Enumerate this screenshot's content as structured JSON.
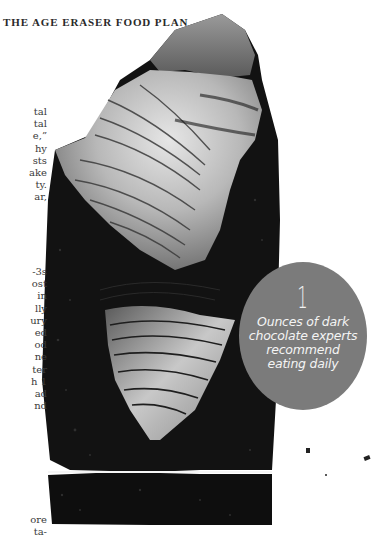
{
  "page": {
    "running_head": "THE AGE ERASER FOOD PLAN"
  },
  "body_text": {
    "paragraph_1_line_endings": [
      "tal",
      "tal",
      "e,”",
      "hy",
      "sts",
      "ake",
      "ty.",
      "ar,"
    ],
    "paragraph_2_line_endings": [
      "-3s",
      "ost",
      "in",
      "lly",
      "ury",
      "ed",
      "od",
      "ne",
      "ter",
      "h 1",
      "ad",
      "nd"
    ],
    "paragraph_3_line_endings": [
      "ore",
      "ta-"
    ]
  },
  "callout": {
    "number": "1",
    "caption_lines": [
      "Ounces of dark",
      "chocolate experts",
      "recommend",
      "eating daily"
    ],
    "background_color": "#7b7b7b",
    "text_color": "#f2f2f2"
  },
  "photo": {
    "subject": "piece of dark chocolate with curled shavings",
    "style": "black-and-white"
  }
}
